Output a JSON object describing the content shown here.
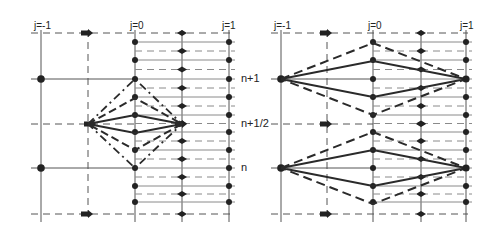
{
  "diagram": {
    "colors": {
      "line": "#3a3a3a",
      "grid": "#555555",
      "fine": "#8a8a8a",
      "background": "#ffffff"
    },
    "column_labels": [
      "j=-1",
      "j=0",
      "j=1"
    ],
    "row_labels": [
      "n+1",
      "n+1/2",
      "n"
    ],
    "panels": [
      {
        "id": "left",
        "cols": {
          "jm1": 41,
          "half_left": 88,
          "j0": 135,
          "half_right": 182,
          "j1": 229
        },
        "rows": {
          "top": 33,
          "n1": 79,
          "nhalf": 124,
          "n": 168,
          "bottom": 214
        },
        "stencil": "diamond at n+1/2 between half-left and half-right nodes",
        "label_y": 23
      },
      {
        "id": "right",
        "cols": {
          "jm1": 281,
          "half_left": 327,
          "j0": 373,
          "half_right": 421,
          "j1": 466
        },
        "rows": {
          "top": 33,
          "n1": 79,
          "nhalf": 124,
          "n": 168,
          "bottom": 214
        },
        "stencil": "diamonds at n+1 and n between j=-1 and j=1 nodes",
        "label_y": 23
      }
    ],
    "labels": {
      "left_jm1": "j=-1",
      "left_j0": "j=0",
      "left_j1": "j=1",
      "right_jm1": "j=-1",
      "right_j0": "j=0",
      "right_j1": "j=1",
      "row_n1": "n+1",
      "row_nhalf": "n+1/2",
      "row_n": "n"
    }
  }
}
